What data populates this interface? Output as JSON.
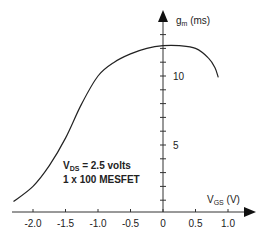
{
  "chart_data": {
    "type": "line",
    "title": "",
    "xlabel": "V_GS (V)",
    "ylabel": "g_m (ms)",
    "xlabel_parts": {
      "main": "V",
      "sub": "GS",
      "unit": " (V)"
    },
    "ylabel_parts": {
      "main": "g",
      "sub": "m",
      "unit": " (ms)"
    },
    "x_ticks": [
      -2.0,
      -1.5,
      -1.0,
      -0.5,
      0,
      0.5,
      1.0
    ],
    "x_tick_labels": [
      "-2.0",
      "-1.5",
      "-1.0",
      "-0.5",
      "0",
      "0.5",
      "1.0"
    ],
    "y_ticks_labeled": [
      5,
      10
    ],
    "y_tick_labels": [
      "5",
      "10"
    ],
    "y_minor_tick_step": 1,
    "xlim": [
      -2.35,
      1.3
    ],
    "ylim": [
      0,
      14
    ],
    "grid": false,
    "legend": null,
    "annotations": [
      {
        "line1_main": "V",
        "line1_sub": "DS",
        "line1_rest": " = 2.5 volts",
        "line2": "1 x 100 MESFET"
      }
    ],
    "series": [
      {
        "name": "g_m vs V_GS",
        "x": [
          -2.3,
          -2.0,
          -1.75,
          -1.5,
          -1.25,
          -1.0,
          -0.75,
          -0.5,
          -0.25,
          0.0,
          0.25,
          0.5,
          0.7,
          0.8,
          0.85
        ],
        "y": [
          0.9,
          2.0,
          3.5,
          5.5,
          8.0,
          10.0,
          11.0,
          11.6,
          12.0,
          12.2,
          12.2,
          12.0,
          11.3,
          10.6,
          9.9
        ]
      }
    ]
  }
}
